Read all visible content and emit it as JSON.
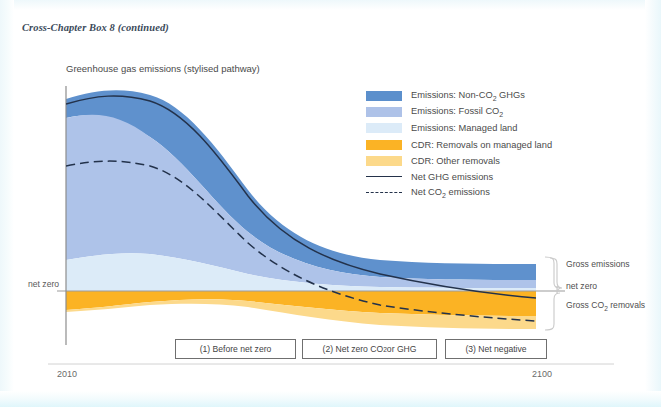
{
  "header": {
    "title": "Cross-Chapter Box 8 (continued)"
  },
  "chart": {
    "title": "Greenhouse gas emissions (stylised pathway)",
    "axis": {
      "net_zero_label": "net zero",
      "x_start": "2010",
      "x_end": "2100"
    },
    "annotations": {
      "gross_emissions": "Gross emissions",
      "net_zero": "net zero",
      "gross_removals_html": "Gross CO<sub>2</sub> removals"
    },
    "phases": [
      {
        "label_html": "(1) Before net zero"
      },
      {
        "label_html": "(2) Net zero CO<sub>2</sub> or GHG"
      },
      {
        "label_html": "(3) Net negative"
      }
    ],
    "legend": [
      {
        "name": "emissions-non-co2-ghgs",
        "kind": "swatch",
        "color": "#5b8fcc",
        "label_html": "Emissions: Non-CO<sub>2</sub> GHGs"
      },
      {
        "name": "emissions-fossil-co2",
        "kind": "swatch",
        "color": "#aec2e8",
        "label_html": "Emissions: Fossil CO<sub>2</sub>"
      },
      {
        "name": "emissions-managed-land",
        "kind": "swatch",
        "color": "#dcebf8",
        "label_html": "Emissions: Managed land"
      },
      {
        "name": "cdr-removals-managed-land",
        "kind": "swatch",
        "color": "#fbb325",
        "label_html": "CDR: Removals on managed land"
      },
      {
        "name": "cdr-other-removals",
        "kind": "swatch",
        "color": "#fcd98a",
        "label_html": "CDR: Other removals"
      },
      {
        "name": "net-ghg-emissions",
        "kind": "line",
        "color": "#24324a",
        "label_html": "Net GHG emissions"
      },
      {
        "name": "net-co2-emissions",
        "kind": "dashed",
        "color": "#24324a",
        "label_html": "Net CO<sub>2</sub> emissions"
      }
    ]
  },
  "chart_data": {
    "type": "area",
    "title": "Greenhouse gas emissions (stylised pathway)",
    "xlabel": "",
    "ylabel": "",
    "xlim": [
      2010,
      2100
    ],
    "ylim": [
      -1.0,
      3.0
    ],
    "grid": false,
    "legend_position": "top-right",
    "note": "Stylised schematic. Values are relative units about the net-zero (y=0) line; positive = gross emissions, negative = gross CO2 removals.",
    "x": [
      2010,
      2020,
      2030,
      2040,
      2050,
      2060,
      2070,
      2080,
      2090,
      2100
    ],
    "series": [
      {
        "name": "Emissions: Managed land",
        "stack": "positive",
        "order": 1,
        "values": [
          0.38,
          0.4,
          0.36,
          0.3,
          0.24,
          0.2,
          0.17,
          0.15,
          0.14,
          0.13
        ]
      },
      {
        "name": "Emissions: Fossil CO2",
        "stack": "positive",
        "order": 2,
        "values": [
          1.55,
          1.66,
          1.52,
          1.14,
          0.74,
          0.46,
          0.3,
          0.22,
          0.18,
          0.16
        ]
      },
      {
        "name": "Emissions: Non-CO2 GHGs",
        "stack": "positive",
        "order": 3,
        "values": [
          0.6,
          0.72,
          0.7,
          0.6,
          0.52,
          0.47,
          0.44,
          0.42,
          0.41,
          0.4
        ]
      },
      {
        "name": "CDR: Removals on managed land",
        "stack": "negative",
        "order": 1,
        "values": [
          -0.2,
          -0.21,
          -0.24,
          -0.3,
          -0.38,
          -0.45,
          -0.5,
          -0.53,
          -0.55,
          -0.56
        ]
      },
      {
        "name": "CDR: Other removals",
        "stack": "negative",
        "order": 2,
        "values": [
          -0.02,
          -0.03,
          -0.06,
          -0.14,
          -0.25,
          -0.34,
          -0.4,
          -0.44,
          -0.46,
          -0.47
        ]
      }
    ],
    "lines": [
      {
        "name": "Net GHG emissions",
        "style": "solid",
        "values": [
          2.31,
          2.54,
          2.28,
          1.6,
          0.87,
          0.34,
          0.01,
          -0.18,
          -0.28,
          -0.34
        ]
      },
      {
        "name": "Net CO2 emissions",
        "style": "dashed",
        "values": [
          1.71,
          1.82,
          1.58,
          1.0,
          0.35,
          -0.13,
          -0.43,
          -0.6,
          -0.69,
          -0.74
        ]
      }
    ],
    "reference_lines": [
      {
        "name": "net zero",
        "y": 0,
        "color": "#9a9a9a"
      }
    ],
    "phase_bands": [
      {
        "label": "(1) Before net zero",
        "x_range": [
          2028,
          2048
        ]
      },
      {
        "label": "(2) Net zero CO2 or GHG",
        "x_range": [
          2049,
          2072
        ]
      },
      {
        "label": "(3) Net negative",
        "x_range": [
          2073,
          2090
        ]
      }
    ]
  }
}
